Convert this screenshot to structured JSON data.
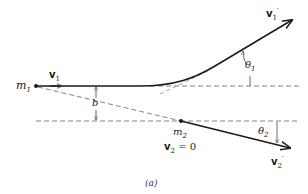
{
  "diagram": {
    "caption": "(a)",
    "labels": {
      "m1": {
        "base": "m",
        "sub": "1"
      },
      "v1": {
        "base": "v",
        "sub": "1"
      },
      "v1_prime": {
        "base": "v",
        "sub": "1",
        "sup": "′"
      },
      "theta1": {
        "base": "θ",
        "sub": "1"
      },
      "b": "b",
      "m2": {
        "base": "m",
        "sub": "2"
      },
      "v2_eq": {
        "base": "v",
        "sub": "2",
        "rest": " = 0"
      },
      "theta2": {
        "base": "θ",
        "sub": "2"
      },
      "v2_prime": {
        "base": "v",
        "sub": "2",
        "sup": "′"
      }
    },
    "colors": {
      "line": "#1a1a1a",
      "dashed": "#777777",
      "background": "#ffffff"
    }
  }
}
